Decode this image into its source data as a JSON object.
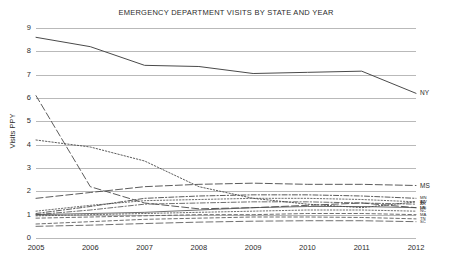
{
  "chart_data": {
    "type": "line",
    "title": "EMERGENCY DEPARTMENT VISITS BY STATE AND YEAR",
    "xlabel": "",
    "ylabel": "Visits PPY",
    "x": [
      2005,
      2006,
      2007,
      2008,
      2009,
      2010,
      2011,
      2012
    ],
    "xtick_labels": [
      "2005",
      "2006",
      "2007",
      "2008",
      "2009",
      "2010",
      "2011",
      "2012"
    ],
    "ytick_labels": [
      "0",
      "1",
      "2",
      "3",
      "4",
      "5",
      "6",
      "7",
      "8",
      "9"
    ],
    "ylim": [
      0,
      9
    ],
    "grid": true,
    "legend_position": "right-inline",
    "series": [
      {
        "name": "NY",
        "label": "NY",
        "values": [
          8.6,
          8.2,
          7.4,
          7.35,
          7.05,
          7.1,
          7.15,
          6.2
        ],
        "dash": "none",
        "width": 1.0,
        "color": "#4a4a4a"
      },
      {
        "name": "MS",
        "label": "MS",
        "values": [
          6.1,
          2.2,
          1.5,
          1.25,
          1.3,
          1.4,
          1.5,
          1.3
        ],
        "dash": "long",
        "width": 0.9,
        "color": "#4a4a4a"
      },
      {
        "name": "MS2",
        "label": "MS",
        "values": [
          1.7,
          1.95,
          2.2,
          2.3,
          2.35,
          2.3,
          2.3,
          2.25
        ],
        "dash": "long",
        "width": 0.9,
        "color": "#4a4a4a"
      },
      {
        "name": "WV",
        "label": "WV",
        "values": [
          4.2,
          3.9,
          3.3,
          2.2,
          1.7,
          1.45,
          1.3,
          1.55
        ],
        "dash": "dot",
        "width": 0.9,
        "color": "#4a4a4a"
      },
      {
        "name": "MN",
        "label": "MN",
        "values": [
          1.05,
          1.35,
          1.7,
          1.8,
          1.85,
          1.85,
          1.8,
          1.7
        ],
        "dash": "dashdot",
        "width": 0.9,
        "color": "#4a4a4a"
      },
      {
        "name": "AZ",
        "label": "AZ",
        "values": [
          1.15,
          1.4,
          1.6,
          1.65,
          1.7,
          1.7,
          1.65,
          1.55
        ],
        "dash": "dot",
        "width": 0.8,
        "color": "#4a4a4a"
      },
      {
        "name": "AR",
        "label": "AR",
        "values": [
          1.0,
          1.2,
          1.45,
          1.5,
          1.55,
          1.55,
          1.5,
          1.45
        ],
        "dash": "dashdot",
        "width": 0.8,
        "color": "#4a4a4a"
      },
      {
        "name": "LA",
        "label": "LA",
        "values": [
          1.0,
          1.05,
          1.1,
          1.2,
          1.3,
          1.35,
          1.35,
          1.3
        ],
        "dash": "none",
        "width": 0.8,
        "color": "#4a4a4a"
      },
      {
        "name": "NC",
        "label": "NC",
        "values": [
          0.95,
          1.0,
          1.05,
          1.1,
          1.15,
          1.2,
          1.2,
          1.15
        ],
        "dash": "dot",
        "width": 0.8,
        "color": "#4a4a4a"
      },
      {
        "name": "MA",
        "label": "MA",
        "values": [
          0.85,
          0.9,
          0.95,
          1.0,
          1.0,
          1.05,
          1.05,
          1.0
        ],
        "dash": "short",
        "width": 0.8,
        "color": "#4a4a4a"
      },
      {
        "name": "TN",
        "label": "TN",
        "values": [
          0.6,
          0.7,
          0.8,
          0.85,
          0.9,
          0.9,
          0.88,
          0.82
        ],
        "dash": "short",
        "width": 0.8,
        "color": "#4a4a4a"
      },
      {
        "name": "SC",
        "label": "SC",
        "values": [
          0.5,
          0.55,
          0.62,
          0.68,
          0.72,
          0.74,
          0.74,
          0.7
        ],
        "dash": "long",
        "width": 0.8,
        "color": "#4a4a4a"
      }
    ]
  }
}
